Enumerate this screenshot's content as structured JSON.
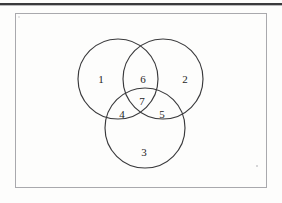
{
  "figure": {
    "kind": "venn-diagram-3-set",
    "background_color": "#fdfdfc",
    "stroke_color": "#3a3a3c",
    "frame_border_color": "#a9a9ad",
    "top_rule_color": "#3a3a3c",
    "label_color": "#1d1d1f"
  },
  "frame": {
    "x": 15,
    "y": 13,
    "width": 252,
    "height": 175
  },
  "circles": [
    {
      "name": "set-a-circle",
      "cx": 118,
      "cy": 79,
      "r": 40
    },
    {
      "name": "set-b-circle",
      "cx": 163,
      "cy": 79,
      "r": 40
    },
    {
      "name": "set-c-circle",
      "cx": 145,
      "cy": 128,
      "r": 40
    }
  ],
  "regions": [
    {
      "id": "region-1",
      "label": "1",
      "x": 101,
      "y": 79,
      "description": "A only"
    },
    {
      "id": "region-2",
      "label": "2",
      "x": 185,
      "y": 79,
      "description": "B only"
    },
    {
      "id": "region-3",
      "label": "3",
      "x": 144,
      "y": 152,
      "description": "C only"
    },
    {
      "id": "region-4",
      "label": "4",
      "x": 122,
      "y": 114,
      "description": "A and C only"
    },
    {
      "id": "region-5",
      "label": "5",
      "x": 162,
      "y": 114,
      "description": "B and C only"
    },
    {
      "id": "region-6",
      "label": "6",
      "x": 143,
      "y": 79,
      "description": "A and B only"
    },
    {
      "id": "region-7",
      "label": "7",
      "x": 142,
      "y": 101,
      "description": "A and B and C"
    }
  ]
}
